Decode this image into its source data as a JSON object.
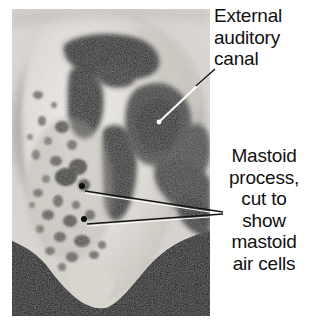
{
  "figure": {
    "type": "anatomy-photograph",
    "background_color": "#ffffff",
    "photo": {
      "frame_color": "#0a0a0a",
      "bone_color": "#e8e6e1",
      "cavity_color": "#3a3a3a"
    }
  },
  "labels": {
    "ear_canal": {
      "text": "External\nauditory\ncanal",
      "line1": "External",
      "line2": "auditory",
      "line3": "canal",
      "align": "left",
      "color": "#111111"
    },
    "mastoid": {
      "text": "Mastoid\nprocess,\ncut to\nshow\nmastoid\nair cells",
      "line1": "Mastoid",
      "line2": "process,",
      "line3": "cut to",
      "line4": "show",
      "line5": "mastoid",
      "line6": "air cells",
      "align": "center",
      "color": "#111111"
    }
  },
  "leader_lines": [
    {
      "name": "ear-canal-leader",
      "from": [
        160,
        121
      ],
      "to": [
        213,
        71
      ],
      "color": "#ffffff"
    },
    {
      "name": "mastoid-leader-upper",
      "from": [
        84,
        190
      ],
      "to": [
        222,
        212
      ],
      "color": "#111111"
    },
    {
      "name": "mastoid-leader-lower",
      "from": [
        86,
        223
      ],
      "to": [
        222,
        214
      ],
      "color": "#111111"
    }
  ],
  "markers": [
    {
      "name": "mastoid-air-cell-dot-upper",
      "at": [
        82,
        186
      ]
    },
    {
      "name": "mastoid-air-cell-dot-lower",
      "at": [
        84,
        219
      ]
    }
  ]
}
